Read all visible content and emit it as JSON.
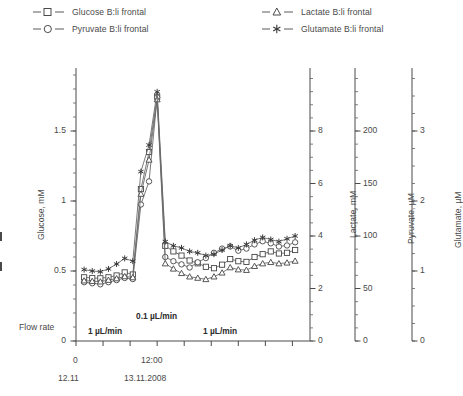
{
  "legend": {
    "items": [
      {
        "label": "Glucose B:li frontal",
        "marker": "square-marker",
        "name": "legend-item-glucose"
      },
      {
        "label": "Pyruvate B:li frontal",
        "marker": "circle-marker",
        "name": "legend-item-pyruvate"
      },
      {
        "label": "Lactate B:li frontal",
        "marker": "triangle-marker",
        "name": "legend-item-lactate"
      },
      {
        "label": "Glutamate B:li frontal",
        "marker": "asterisk-marker",
        "name": "legend-item-glutamate"
      }
    ]
  },
  "axes": {
    "glucose": {
      "title": "Glucose, mM",
      "ticks": [
        "0",
        "0.5",
        "1",
        "1.5"
      ]
    },
    "lactate": {
      "title": "Lactate, mM",
      "ticks": [
        "0",
        "2",
        "4",
        "6",
        "8"
      ]
    },
    "pyruvate": {
      "title": "Pyruvate, µM",
      "ticks": [
        "0",
        "50",
        "100",
        "150",
        "200"
      ]
    },
    "glutamate": {
      "title": "Glutamate, µM",
      "ticks": [
        "0",
        "1",
        "2",
        "3"
      ]
    }
  },
  "xaxis": {
    "labels": [
      "0",
      "12:00"
    ],
    "dates": [
      "12.11",
      "13.11.2008"
    ]
  },
  "annotations": {
    "flow_rate_label": "Flow rate",
    "flow_left": "1 µL/min",
    "flow_mid": "0.1 µL/min",
    "flow_right": "1 µL/min"
  },
  "chart_data": {
    "type": "line",
    "title": "",
    "xlabel": "",
    "ylabel": "Glucose, mM",
    "grid": false,
    "legend_position": "top",
    "x_tick_values": [
      0,
      1,
      2,
      3,
      4,
      5,
      6,
      7,
      8
    ],
    "x_tick_labels": [
      "0",
      "",
      "",
      "12:00",
      "",
      "",
      "",
      "",
      ""
    ],
    "x_axis_dates": [
      "12.11",
      "13.11.2008"
    ],
    "xlim": [
      0,
      8.65
    ],
    "axes_definitions": [
      {
        "name": "Glucose, mM",
        "unit": "mM",
        "ylim": [
          0,
          1.95
        ],
        "ticks": [
          0,
          0.5,
          1,
          1.5
        ],
        "minor_step": 0.1
      },
      {
        "name": "Lactate, mM",
        "unit": "mM",
        "ylim": [
          0,
          10.4
        ],
        "ticks": [
          0,
          2,
          4,
          6,
          8
        ],
        "minor_step": 0.5
      },
      {
        "name": "Pyruvate, µM",
        "unit": "µM",
        "ylim": [
          0,
          260
        ],
        "ticks": [
          0,
          50,
          100,
          150,
          200
        ],
        "minor_step": 12.5
      },
      {
        "name": "Glutamate, µM",
        "unit": "µM",
        "ylim": [
          0,
          3.9
        ],
        "ticks": [
          0,
          1,
          2,
          3
        ],
        "minor_step": 0.25
      }
    ],
    "flow_rate_segments": [
      {
        "label": "1 µL/min",
        "value": 1,
        "unit": "µL/min"
      },
      {
        "label": "0.1 µL/min",
        "value": 0.1,
        "unit": "µL/min"
      },
      {
        "label": "1 µL/min",
        "value": 1,
        "unit": "µL/min"
      }
    ],
    "series": [
      {
        "name": "Glucose B:li frontal",
        "axis": "Glucose, mM",
        "marker": "open-square",
        "x": [
          0.3,
          0.6,
          0.9,
          1.2,
          1.5,
          1.8,
          2.1,
          2.4,
          2.7,
          3.0,
          3.3,
          3.6,
          3.9,
          4.2,
          4.5,
          4.8,
          5.1,
          5.4,
          5.7,
          6.0,
          6.3,
          6.6,
          6.9,
          7.2,
          7.5,
          7.8,
          8.1
        ],
        "values": [
          0.455,
          0.45,
          0.448,
          0.455,
          0.468,
          0.49,
          0.475,
          1.085,
          1.35,
          1.745,
          0.68,
          0.64,
          0.61,
          0.575,
          0.555,
          0.53,
          0.52,
          0.545,
          0.585,
          0.57,
          0.565,
          0.6,
          0.62,
          0.64,
          0.625,
          0.63,
          0.65
        ]
      },
      {
        "name": "Pyruvate B:li frontal",
        "axis": "Pyruvate, µM",
        "marker": "open-circle",
        "x": [
          0.3,
          0.6,
          0.9,
          1.2,
          1.5,
          1.8,
          2.1,
          2.4,
          2.7,
          3.0,
          3.3,
          3.6,
          3.9,
          4.2,
          4.5,
          4.8,
          5.1,
          5.4,
          5.7,
          6.0,
          6.3,
          6.6,
          6.9,
          7.2,
          7.5,
          7.8,
          8.1
        ],
        "values": [
          56,
          55,
          54,
          56,
          58,
          60,
          59,
          130,
          152,
          232,
          80,
          76,
          73,
          70,
          75,
          79,
          84,
          88,
          90,
          86,
          88,
          92,
          95,
          93,
          90,
          91,
          94
        ]
      },
      {
        "name": "Lactate B:li frontal",
        "axis": "Lactate, mM",
        "marker": "open-triangle",
        "x": [
          0.3,
          0.6,
          0.9,
          1.2,
          1.5,
          1.8,
          2.1,
          2.4,
          2.7,
          3.0,
          3.3,
          3.6,
          3.9,
          4.2,
          4.5,
          4.8,
          5.1,
          5.4,
          5.7,
          6.0,
          6.3,
          6.6,
          6.9,
          7.2,
          7.5,
          7.8,
          8.1
        ],
        "values": [
          2.3,
          2.28,
          2.26,
          2.32,
          2.38,
          2.46,
          2.42,
          5.6,
          6.9,
          9.2,
          2.95,
          2.75,
          2.58,
          2.45,
          2.4,
          2.35,
          2.45,
          2.6,
          2.8,
          2.72,
          2.7,
          2.85,
          2.95,
          3.0,
          2.95,
          2.98,
          3.05
        ]
      },
      {
        "name": "Glutamate B:li frontal",
        "axis": "Glutamate, µM",
        "marker": "asterisk",
        "x": [
          0.3,
          0.6,
          0.9,
          1.2,
          1.5,
          1.8,
          2.1,
          2.4,
          2.7,
          3.0,
          3.3,
          3.6,
          3.9,
          4.2,
          4.5,
          4.8,
          5.1,
          5.4,
          5.7,
          6.0,
          6.3,
          6.6,
          6.9,
          7.2,
          7.5,
          7.8,
          8.1
        ],
        "values": [
          1.02,
          1.0,
          0.99,
          1.03,
          1.1,
          1.18,
          1.14,
          2.42,
          2.8,
          3.56,
          1.42,
          1.36,
          1.33,
          1.28,
          1.26,
          1.22,
          1.24,
          1.3,
          1.36,
          1.33,
          1.38,
          1.44,
          1.48,
          1.45,
          1.42,
          1.46,
          1.5
        ]
      }
    ]
  }
}
